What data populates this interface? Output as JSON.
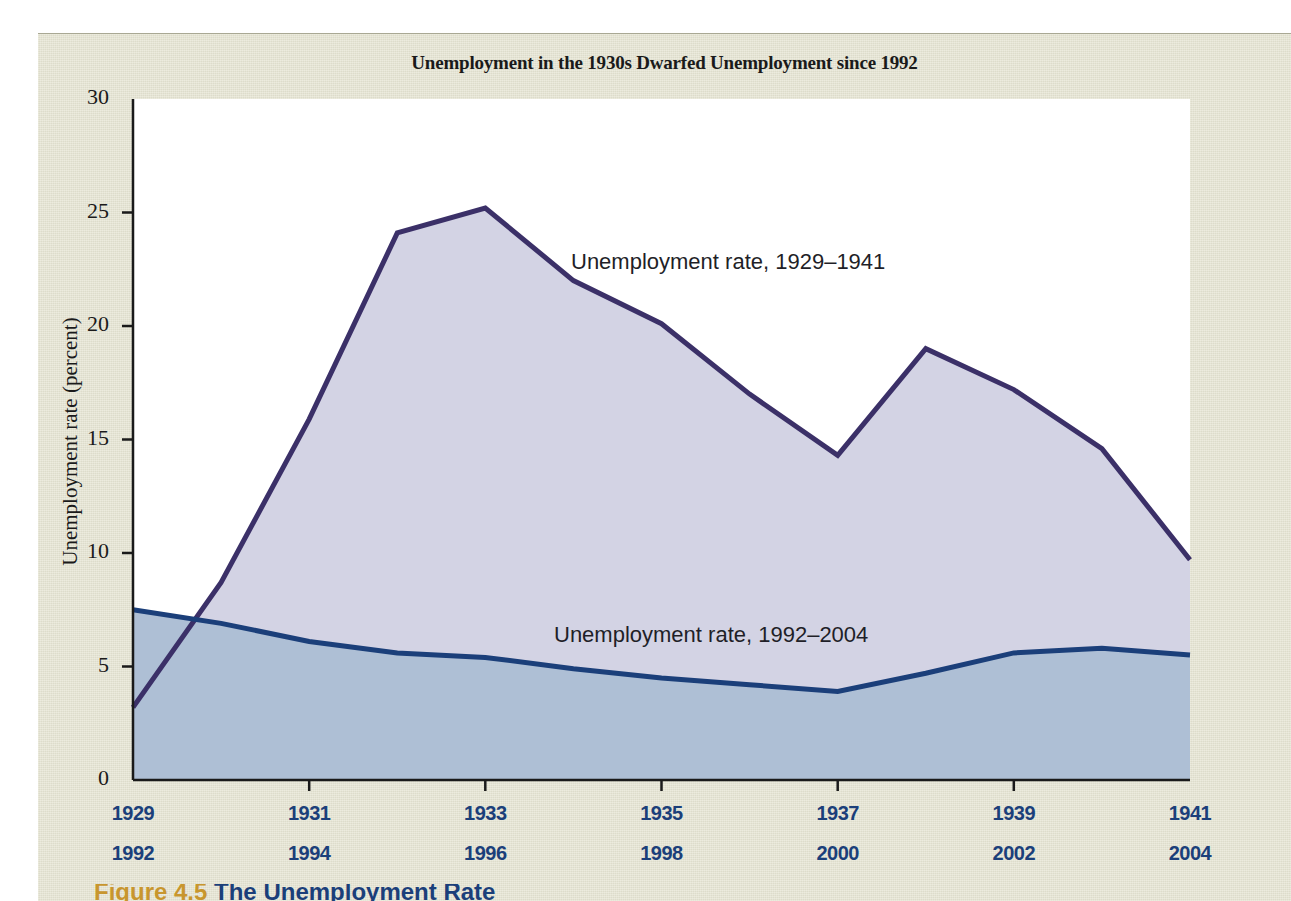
{
  "figure": {
    "title": "Unemployment in the 1930s Dwarfed Unemployment since 1992",
    "caption_label": "Figure 4.5",
    "caption_rest": "The Unemployment Rate",
    "panel_background": "#e4e3d0"
  },
  "axes": {
    "y_title": "Unemployment rate (percent)",
    "y_ticks": [
      "30",
      "25",
      "20",
      "15",
      "10",
      "5",
      "0"
    ],
    "x_ticks_top": [
      "1929",
      "1931",
      "1933",
      "1935",
      "1937",
      "1939",
      "1941"
    ],
    "x_ticks_bottom": [
      "1992",
      "1994",
      "1996",
      "1998",
      "2000",
      "2002",
      "2004"
    ]
  },
  "annotations": {
    "depression_label": "Unemployment rate, 1929–1941",
    "modern_label": "Unemployment rate, 1992–2004"
  },
  "colors": {
    "depression_line": "#3b3068",
    "depression_fill": "#d3d3e4",
    "modern_line": "#1b3f7a",
    "modern_fill": "#aebfd5",
    "plot_background": "#ffffff",
    "axis": "#1a1a1a",
    "tick_label": "#1b3f7a"
  },
  "chart_data": {
    "type": "area",
    "title": "Unemployment in the 1930s Dwarfed Unemployment since 1992",
    "xlabel": "",
    "ylabel": "Unemployment rate (percent)",
    "ylim": [
      0,
      30
    ],
    "ytick_step": 5,
    "grid": false,
    "legend": "inline-annotations",
    "x_index": [
      0,
      1,
      2,
      3,
      4,
      5,
      6,
      7,
      8,
      9,
      10,
      11,
      12
    ],
    "series": [
      {
        "name": "Unemployment rate, 1929–1941",
        "x": [
          1929,
          1930,
          1931,
          1932,
          1933,
          1934,
          1935,
          1936,
          1937,
          1938,
          1939,
          1940,
          1941
        ],
        "values": [
          3.2,
          8.7,
          15.9,
          24.1,
          25.2,
          22.0,
          20.1,
          17.0,
          14.3,
          19.0,
          17.2,
          14.6,
          9.7
        ],
        "line_color": "#3b3068",
        "fill_color": "#d3d3e4"
      },
      {
        "name": "Unemployment rate, 1992–2004",
        "x": [
          1992,
          1993,
          1994,
          1995,
          1996,
          1997,
          1998,
          1999,
          2000,
          2001,
          2002,
          2003,
          2004
        ],
        "values": [
          7.5,
          6.9,
          6.1,
          5.6,
          5.4,
          4.9,
          4.5,
          4.2,
          3.9,
          4.7,
          5.6,
          5.8,
          5.5
        ],
        "line_color": "#1b3f7a",
        "fill_color": "#aebfd5"
      }
    ]
  }
}
